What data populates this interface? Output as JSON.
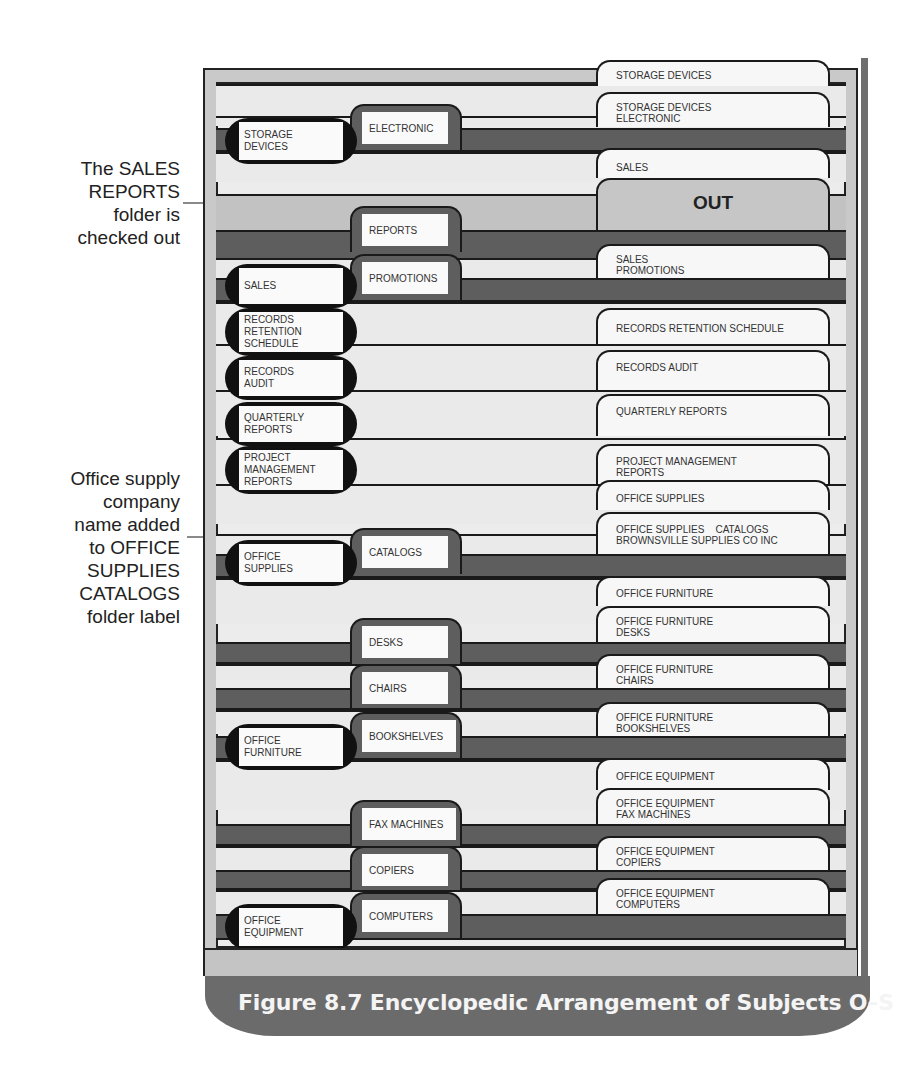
{
  "callouts": {
    "checked_out": "The SALES\nREPORTS\nfolder is\nchecked out",
    "company_name": "Office supply\ncompany\nname added\nto OFFICE\nSUPPLIES\nCATALOGS\nfolder label"
  },
  "primary_guides": [
    {
      "label": "STORAGE\nDEVICES"
    },
    {
      "label": "SALES"
    },
    {
      "label": "RECORDS\nRETENTION\nSCHEDULE"
    },
    {
      "label": "RECORDS\nAUDIT"
    },
    {
      "label": "QUARTERLY\nREPORTS"
    },
    {
      "label": "PROJECT\nMANAGEMENT\nREPORTS"
    },
    {
      "label": "OFFICE\nSUPPLIES"
    },
    {
      "label": "OFFICE\nFURNITURE"
    },
    {
      "label": "OFFICE\nEQUIPMENT"
    }
  ],
  "secondary_guides": [
    {
      "label": "ELECTRONIC"
    },
    {
      "label": "REPORTS"
    },
    {
      "label": "PROMOTIONS"
    },
    {
      "label": "CATALOGS"
    },
    {
      "label": "DESKS"
    },
    {
      "label": "CHAIRS"
    },
    {
      "label": "BOOKSHELVES"
    },
    {
      "label": "FAX MACHINES"
    },
    {
      "label": "COPIERS"
    },
    {
      "label": "COMPUTERS"
    }
  ],
  "folder_tabs": [
    {
      "label": "STORAGE DEVICES"
    },
    {
      "label": "STORAGE DEVICES\nELECTRONIC"
    },
    {
      "label": "SALES"
    },
    {
      "label": "OUT"
    },
    {
      "label": "SALES\nPROMOTIONS"
    },
    {
      "label": "RECORDS RETENTION SCHEDULE"
    },
    {
      "label": "RECORDS AUDIT"
    },
    {
      "label": "QUARTERLY REPORTS"
    },
    {
      "label": "PROJECT MANAGEMENT\nREPORTS"
    },
    {
      "label": "OFFICE SUPPLIES"
    },
    {
      "label": "OFFICE SUPPLIES    CATALOGS\nBROWNSVILLE SUPPLIES CO INC"
    },
    {
      "label": "OFFICE FURNITURE"
    },
    {
      "label": "OFFICE FURNITURE\nDESKS"
    },
    {
      "label": "OFFICE FURNITURE\nCHAIRS"
    },
    {
      "label": "OFFICE FURNITURE\nBOOKSHELVES"
    },
    {
      "label": "OFFICE EQUIPMENT"
    },
    {
      "label": "OFFICE EQUIPMENT\nFAX MACHINES"
    },
    {
      "label": "OFFICE EQUIPMENT\nCOPIERS"
    },
    {
      "label": "OFFICE EQUIPMENT\nCOMPUTERS"
    }
  ],
  "caption": "Figure 8.7  Encyclopedic Arrangement of Subjects O–S",
  "colors": {
    "guide_dark": "#5e5e5e",
    "folder_light": "#eaeaea",
    "out_guide": "#c2c2c2",
    "caption_bg": "#6b6b6b",
    "callout_line": "#8a8a8a"
  }
}
